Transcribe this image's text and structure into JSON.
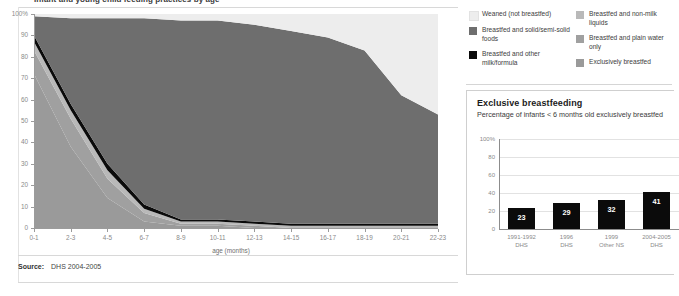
{
  "main_chart": {
    "title": "Infant and young child feeding practices by age",
    "y_axis_ticks": [
      "100%",
      "90",
      "80",
      "70",
      "60",
      "50",
      "40",
      "30",
      "20",
      "10",
      "0"
    ],
    "x_axis_label": "age (months)",
    "x_axis_ticks": [
      "0-1",
      "2-3",
      "4-5",
      "6-7",
      "8-9",
      "10-11",
      "12-13",
      "14-15",
      "16-17",
      "18-19",
      "20-21",
      "22-23"
    ],
    "source_label": "Source:",
    "source_value": "DHS 2004-2005"
  },
  "legend": {
    "items": [
      {
        "label": "Weaned (not breastfed)",
        "color": "#ededed"
      },
      {
        "label": "Breastfed and non-milk liquids",
        "color": "#b9b9b9"
      },
      {
        "label": "Breastfed and solid/semi-solid foods",
        "color": "#6e6e6e"
      },
      {
        "label": "Breastfed and plain water only",
        "color": "#a0a0a0"
      },
      {
        "label": "Breastfed and other milk/formula",
        "color": "#0b0b0b"
      },
      {
        "label": "Exclusively breastfed",
        "color": "#9a9a9a"
      }
    ]
  },
  "card": {
    "title": "Exclusive breastfeeding",
    "subtitle": "Percentage of infants < 6 months old exclusively breastfed"
  },
  "chart_data": [
    {
      "type": "area",
      "title": "Infant and young child feeding practices by age",
      "xlabel": "age (months)",
      "ylabel": "",
      "ylim": [
        0,
        100
      ],
      "grid": false,
      "legend_position": "right",
      "stacked": true,
      "x": [
        "0-1",
        "2-3",
        "4-5",
        "6-7",
        "8-9",
        "10-11",
        "12-13",
        "14-15",
        "16-17",
        "18-19",
        "20-21",
        "22-23"
      ],
      "series": [
        {
          "name": "Exclusively breastfed",
          "color": "#9a9a9a",
          "values": [
            72,
            38,
            14,
            3,
            1,
            1,
            0,
            0,
            0,
            0,
            0,
            0
          ]
        },
        {
          "name": "Breastfed and plain water only",
          "color": "#a0a0a0",
          "values": [
            11,
            13,
            9,
            4,
            1,
            1,
            1,
            0,
            0,
            0,
            0,
            0
          ]
        },
        {
          "name": "Breastfed and non-milk liquids",
          "color": "#b9b9b9",
          "values": [
            4,
            4,
            4,
            2,
            1,
            1,
            1,
            1,
            1,
            1,
            1,
            1
          ]
        },
        {
          "name": "Breastfed and other milk/formula",
          "color": "#0b0b0b",
          "values": [
            3,
            3,
            3,
            2,
            1,
            1,
            1,
            1,
            1,
            1,
            1,
            1
          ]
        },
        {
          "name": "Breastfed and solid/semi-solid foods",
          "color": "#6e6e6e",
          "values": [
            9,
            40,
            68,
            87,
            93,
            93,
            92,
            90,
            87,
            81,
            60,
            51
          ]
        },
        {
          "name": "Weaned (not breastfed)",
          "color": "#ededed",
          "values": [
            1,
            2,
            2,
            2,
            3,
            3,
            5,
            8,
            11,
            17,
            38,
            47
          ]
        }
      ]
    },
    {
      "type": "bar",
      "title": "Exclusive breastfeeding",
      "subtitle": "Percentage of infants < 6 months old exclusively breastfed",
      "xlabel": "",
      "ylabel": "",
      "ylim": [
        0,
        100
      ],
      "y_axis_ticks": [
        "100%",
        "80",
        "60",
        "40",
        "20",
        "0"
      ],
      "categories": [
        "1991-1992 DHS",
        "1996 DHS",
        "1999 Other NS",
        "2004-2005 DHS"
      ],
      "category_lines": [
        [
          "1991-1992",
          "DHS"
        ],
        [
          "1996",
          "DHS"
        ],
        [
          "1999",
          "Other NS"
        ],
        [
          "2004-2005",
          "DHS"
        ]
      ],
      "values": [
        23,
        29,
        32,
        41
      ],
      "bar_color": "#0b0b0b",
      "grid": true
    }
  ]
}
